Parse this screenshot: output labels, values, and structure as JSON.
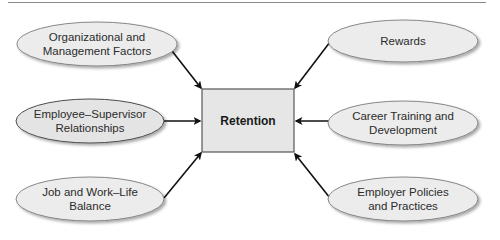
{
  "diagram": {
    "type": "influence-diagram",
    "center": {
      "label": "Retention",
      "fill": "#e6e6e6",
      "stroke": "#555555"
    },
    "nodes": [
      {
        "id": "org",
        "line1": "Organizational and",
        "line2": "Management Factors",
        "side": "left"
      },
      {
        "id": "emp",
        "line1": "Employee–Supervisor",
        "line2": "Relationships",
        "side": "left"
      },
      {
        "id": "job",
        "line1": "Job and Work–Life",
        "line2": "Balance",
        "side": "left"
      },
      {
        "id": "rew",
        "line1": "Rewards",
        "line2": "",
        "side": "right"
      },
      {
        "id": "car",
        "line1": "Career Training and",
        "line2": "Development",
        "side": "right"
      },
      {
        "id": "pol",
        "line1": "Employer Policies",
        "line2": "and Practices",
        "side": "right"
      }
    ],
    "edges": [
      {
        "from": "org",
        "to": "Retention"
      },
      {
        "from": "emp",
        "to": "Retention"
      },
      {
        "from": "job",
        "to": "Retention"
      },
      {
        "from": "rew",
        "to": "Retention"
      },
      {
        "from": "car",
        "to": "Retention"
      },
      {
        "from": "pol",
        "to": "Retention"
      }
    ],
    "colors": {
      "ellipse_fill": "#ececec",
      "ellipse_stroke": "#7a7a7a",
      "arrow": "#111111",
      "rule": "#8a8a8a"
    }
  }
}
